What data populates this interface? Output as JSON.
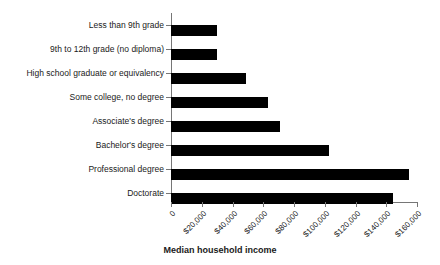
{
  "chart_data": {
    "type": "bar",
    "orientation": "horizontal",
    "title": "",
    "xlabel": "Median household income",
    "ylabel": "",
    "categories": [
      "Less than 9th grade",
      "9th to 12th grade (no diploma)",
      "High school graduate or equivalency",
      "Some college, no degree",
      "Associate's degree",
      "Bachelor's degree",
      "Professional degree",
      "Doctorate"
    ],
    "values": [
      30000,
      30000,
      48800,
      63100,
      70900,
      102800,
      154800,
      144400
    ],
    "xlim": [
      0,
      160000
    ],
    "ylim": null,
    "xticks": [
      0,
      20000,
      40000,
      60000,
      80000,
      100000,
      120000,
      140000,
      160000
    ],
    "xtick_labels": [
      "0",
      "$20,000",
      "$40,000",
      "$60,000",
      "$80,000",
      "$100,000",
      "$120,000",
      "$140,000",
      "$160,000"
    ],
    "grid": false,
    "legend": null,
    "bar_color": "#000000",
    "background_color": "#ffffff",
    "axis_color": "#767676"
  }
}
